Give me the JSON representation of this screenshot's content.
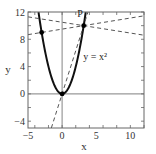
{
  "chart_data": {
    "type": "line",
    "title": "",
    "xlabel": "x",
    "ylabel": "y",
    "xlim": [
      -5,
      12
    ],
    "ylim": [
      -5,
      12
    ],
    "x_ticks": [
      -5,
      0,
      5,
      10
    ],
    "y_ticks": [
      -4,
      0,
      4,
      8,
      12
    ],
    "x_tick_labels": [
      "−5",
      "0",
      "5",
      "10"
    ],
    "y_tick_labels": [
      "−4",
      "0",
      "4",
      "8",
      "12"
    ],
    "grid": false,
    "legend": null,
    "reference_lines": [
      {
        "orientation": "vertical",
        "value": 0,
        "color": "#999999"
      },
      {
        "orientation": "horizontal",
        "value": 0,
        "color": "#999999"
      }
    ],
    "series": [
      {
        "name": "y = x^2",
        "style": "solid",
        "color": "#111111",
        "function": "x^2",
        "x_range": [
          -3.46,
          3.46
        ]
      },
      {
        "name": "line through (-3, 9) and P",
        "style": "dashed",
        "color": "#555555",
        "x": [
          -5,
          12
        ],
        "y": [
          8.68,
          11.44
        ]
      },
      {
        "name": "line through P (descending)",
        "style": "dashed",
        "color": "#555555",
        "x": [
          -5,
          12
        ],
        "y": [
          11.29,
          8.6
        ]
      },
      {
        "name": "line through origin and P",
        "style": "dashed",
        "color": "#555555",
        "x": [
          -1.58,
          3.79
        ],
        "y": [
          -5,
          12
        ]
      }
    ],
    "points": [
      {
        "label": "P",
        "x": 3.16,
        "y": 10
      },
      {
        "label": "",
        "x": -3,
        "y": 9
      },
      {
        "label": "",
        "x": 0,
        "y": 0
      }
    ],
    "annotations": [
      {
        "text": "y = x²",
        "x": 3.1,
        "y": 4.9
      },
      {
        "text": "P",
        "x": 2.2,
        "y": 11.2
      }
    ]
  }
}
